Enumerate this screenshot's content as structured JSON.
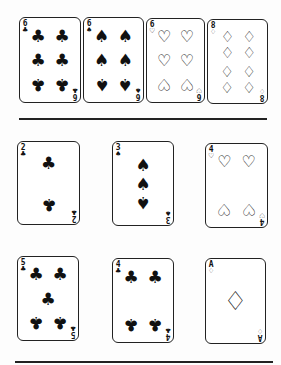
{
  "rows": [
    {
      "name": "top-row",
      "cards": [
        {
          "rank": "6",
          "suit": "clubs",
          "glyph": "♣",
          "x": 19,
          "y": 17,
          "w": 62,
          "h": 86
        },
        {
          "rank": "6",
          "suit": "spades",
          "glyph": "♠",
          "x": 83,
          "y": 17,
          "w": 61,
          "h": 86
        },
        {
          "rank": "6",
          "suit": "hearts",
          "glyph": "♡",
          "x": 146,
          "y": 18,
          "w": 59,
          "h": 85
        },
        {
          "rank": "8",
          "suit": "diamonds",
          "glyph": "♢",
          "x": 207,
          "y": 19,
          "w": 61,
          "h": 85
        }
      ]
    },
    {
      "name": "middle-row",
      "cards": [
        {
          "rank": "2",
          "suit": "clubs",
          "glyph": "♣",
          "x": 17,
          "y": 141,
          "w": 63,
          "h": 84
        },
        {
          "rank": "3",
          "suit": "spades",
          "glyph": "♠",
          "x": 112,
          "y": 141,
          "w": 62,
          "h": 85
        },
        {
          "rank": "4",
          "suit": "hearts",
          "glyph": "♡",
          "x": 205,
          "y": 143,
          "w": 63,
          "h": 85
        }
      ]
    },
    {
      "name": "bottom-row",
      "cards": [
        {
          "rank": "5",
          "suit": "clubs",
          "glyph": "♣",
          "x": 17,
          "y": 256,
          "w": 62,
          "h": 85
        },
        {
          "rank": "4",
          "suit": "clubs",
          "glyph": "♣",
          "x": 112,
          "y": 258,
          "w": 62,
          "h": 85
        },
        {
          "rank": "A",
          "suit": "diamonds",
          "glyph": "♢",
          "x": 205,
          "y": 258,
          "w": 61,
          "h": 86
        }
      ]
    }
  ],
  "dividers": [
    {
      "x": 19,
      "y": 118,
      "w": 248
    },
    {
      "x": 15,
      "y": 361,
      "w": 258
    }
  ]
}
